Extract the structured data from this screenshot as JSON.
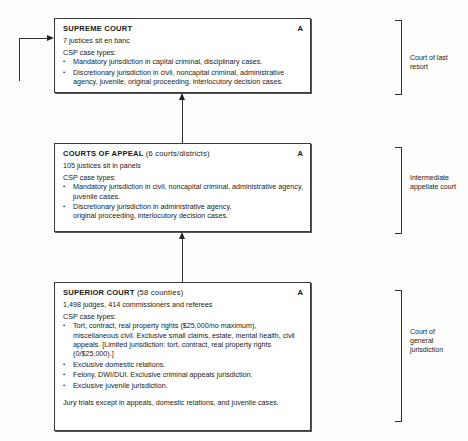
{
  "courts": [
    {
      "title": "SUPREME COURT",
      "subtitle": "",
      "badge": "A",
      "staff": "7 justices sit en banc",
      "case_types_label": "CSP case types:",
      "case_types": [
        "Mandatory jurisdiction in capital criminal, disciplinary cases.",
        "Discretionary jurisdiction in civil, noncapital criminal, administrative agency, juvenile, original proceeding, interlocutory decision cases."
      ],
      "footer": "",
      "level_label": "Court of last resort"
    },
    {
      "title": "COURTS OF APPEAL",
      "subtitle": "(6 courts/districts)",
      "badge": "A",
      "staff": "105 justices sit in panels",
      "case_types_label": "CSP case types:",
      "case_types": [
        "Mandatory jurisdiction in civil, noncapital criminal, administrative agency, juvenile cases.",
        "Discretionary jurisdiction in administrative agency, original proceeding, interlocutory decision cases."
      ],
      "footer": "",
      "level_label": "Intermediate appellate court"
    },
    {
      "title": "SUPERIOR COURT",
      "subtitle": "(58 counties)",
      "badge": "A",
      "staff": "1,498 judges, 414 commissioners and referees",
      "case_types_label": "CSP case types:",
      "case_types": [
        "Tort, contract, real property rights ($25,000/no maximum), miscellaneous civil. Exclusive small claims, estate, mental health, civil appeals. [Limited jurisdiction: tort, contract, real property rights (0/$25,000).]",
        "Exclusive domestic relations.",
        "Felony, DWI/DUI. Exclusive criminal appeals jurisdiction.",
        "Exclusive juvenile jurisdiction."
      ],
      "footer": "Jury trials except in appeals, domestic relations, and juvenile cases.",
      "level_label": "Court of general jurisdiction"
    }
  ]
}
